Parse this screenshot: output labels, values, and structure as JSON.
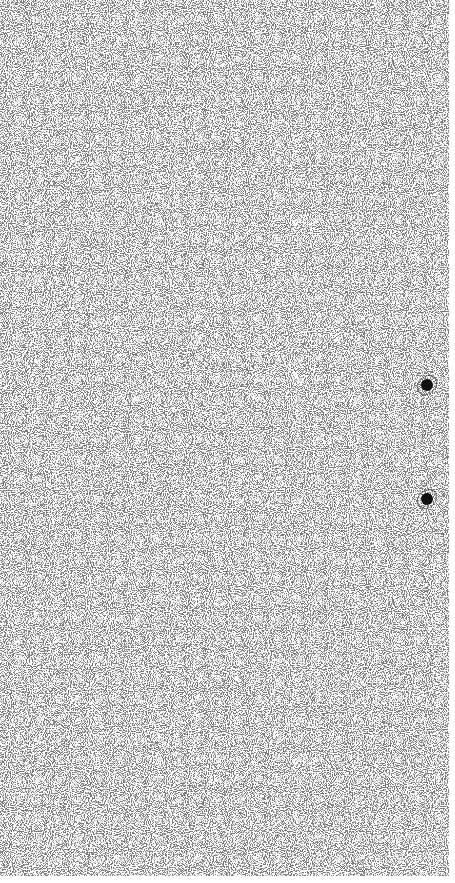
{
  "canvas": {
    "width": 455,
    "height": 883,
    "background": "#ffffff"
  },
  "noise_panel": {
    "width": 449,
    "height": 876,
    "base_color": "#ffffff",
    "grain_color": "#555555",
    "density": 0.5
  },
  "markers": [
    {
      "id": "marker-1",
      "x": 427,
      "y": 385,
      "color": "#111111"
    },
    {
      "id": "marker-2",
      "x": 427,
      "y": 499,
      "color": "#111111"
    }
  ]
}
